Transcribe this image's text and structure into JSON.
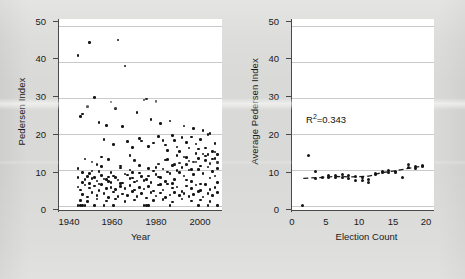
{
  "figure": {
    "background_color": "#d9d9d7",
    "panel_background": "#ffffff",
    "dot_color": "#151515",
    "axis_color": "#4a4a4a",
    "grid_color": "#c9c9c9"
  },
  "chart_data": [
    {
      "type": "scatter",
      "panel": "left",
      "title": "",
      "xlabel": "Year",
      "ylabel": "Pedersen Index",
      "xlim": [
        1938,
        2007
      ],
      "ylim": [
        -1.5,
        52
      ],
      "xticks": [
        1940,
        1960,
        1980,
        2000
      ],
      "yticks": [
        0,
        10,
        20,
        30,
        40,
        50
      ],
      "xticklabels": [
        "1940",
        "1960",
        "1980",
        "2000"
      ],
      "yticklabels": [
        "0",
        "10",
        "20",
        "30",
        "40",
        "50"
      ],
      "grid": true,
      "grid_axis": "y",
      "legend": "none",
      "points": [
        [
          1946,
          41.8
        ],
        [
          1951,
          45.4
        ],
        [
          1963,
          46.2
        ],
        [
          1966,
          38.9
        ],
        [
          1953,
          30.1
        ],
        [
          1960,
          28.9
        ],
        [
          1950,
          27.6
        ],
        [
          1962,
          27.1
        ],
        [
          1947,
          24.9
        ],
        [
          1948,
          25.5
        ],
        [
          1975,
          29.7
        ],
        [
          1974,
          29.4
        ],
        [
          1979,
          29.0
        ],
        [
          1971,
          26.0
        ],
        [
          1977,
          24.0
        ],
        [
          1958,
          22.3
        ],
        [
          1955,
          23.1
        ],
        [
          1965,
          22.0
        ],
        [
          1981,
          22.8
        ],
        [
          1985,
          23.6
        ],
        [
          1991,
          22.2
        ],
        [
          1995,
          21.5
        ],
        [
          1999,
          20.9
        ],
        [
          2002,
          20.1
        ],
        [
          1957,
          18.4
        ],
        [
          1961,
          17.1
        ],
        [
          1967,
          17.9
        ],
        [
          1969,
          16.2
        ],
        [
          1972,
          18.7
        ],
        [
          1973,
          18.0
        ],
        [
          1976,
          16.4
        ],
        [
          1978,
          17.4
        ],
        [
          1980,
          19.2
        ],
        [
          1982,
          18.1
        ],
        [
          1983,
          16.9
        ],
        [
          1984,
          15.4
        ],
        [
          1986,
          19.6
        ],
        [
          1987,
          18.2
        ],
        [
          1988,
          16.3
        ],
        [
          1989,
          15.0
        ],
        [
          1990,
          18.9
        ],
        [
          1992,
          17.6
        ],
        [
          1993,
          16.1
        ],
        [
          1994,
          19.1
        ],
        [
          1996,
          17.2
        ],
        [
          1997,
          15.8
        ],
        [
          1998,
          18.4
        ],
        [
          2000,
          16.0
        ],
        [
          2001,
          19.8
        ],
        [
          2003,
          15.1
        ],
        [
          2004,
          17.3
        ],
        [
          2005,
          14.2
        ],
        [
          1949,
          13.0
        ],
        [
          1952,
          12.1
        ],
        [
          1954,
          11.4
        ],
        [
          1956,
          13.5
        ],
        [
          1959,
          12.8
        ],
        [
          1964,
          11.0
        ],
        [
          1968,
          13.9
        ],
        [
          1970,
          12.5
        ],
        [
          1946,
          10.4
        ],
        [
          1948,
          9.2
        ],
        [
          1950,
          8.1
        ],
        [
          1952,
          7.6
        ],
        [
          1954,
          6.9
        ],
        [
          1956,
          8.4
        ],
        [
          1958,
          7.2
        ],
        [
          1960,
          6.4
        ],
        [
          1962,
          7.9
        ],
        [
          1964,
          6.1
        ],
        [
          1966,
          8.8
        ],
        [
          1968,
          7.5
        ],
        [
          1970,
          6.6
        ],
        [
          1972,
          9.1
        ],
        [
          1974,
          7.0
        ],
        [
          1976,
          8.2
        ],
        [
          1978,
          9.6
        ],
        [
          1980,
          8.0
        ],
        [
          1982,
          10.2
        ],
        [
          1984,
          9.4
        ],
        [
          1986,
          11.1
        ],
        [
          1988,
          9.8
        ],
        [
          1990,
          10.6
        ],
        [
          1992,
          11.4
        ],
        [
          1994,
          10.0
        ],
        [
          1996,
          12.2
        ],
        [
          1998,
          11.0
        ],
        [
          2000,
          12.6
        ],
        [
          2002,
          11.8
        ],
        [
          2004,
          13.1
        ],
        [
          2005,
          12.0
        ],
        [
          1946,
          5.2
        ],
        [
          1947,
          4.4
        ],
        [
          1948,
          3.1
        ],
        [
          1949,
          5.8
        ],
        [
          1950,
          2.4
        ],
        [
          1951,
          4.9
        ],
        [
          1952,
          3.6
        ],
        [
          1953,
          5.5
        ],
        [
          1954,
          2.8
        ],
        [
          1955,
          4.2
        ],
        [
          1956,
          5.9
        ],
        [
          1957,
          3.4
        ],
        [
          1958,
          4.7
        ],
        [
          1959,
          2.2
        ],
        [
          1960,
          5.1
        ],
        [
          1961,
          3.8
        ],
        [
          1962,
          4.5
        ],
        [
          1963,
          2.6
        ],
        [
          1964,
          5.4
        ],
        [
          1965,
          3.2
        ],
        [
          1966,
          4.8
        ],
        [
          1967,
          2.9
        ],
        [
          1968,
          5.6
        ],
        [
          1969,
          3.9
        ],
        [
          1970,
          4.3
        ],
        [
          1971,
          2.5
        ],
        [
          1972,
          5.0
        ],
        [
          1973,
          3.3
        ],
        [
          1974,
          4.6
        ],
        [
          1975,
          2.1
        ],
        [
          1976,
          5.3
        ],
        [
          1977,
          3.7
        ],
        [
          1978,
          4.1
        ],
        [
          1979,
          2.7
        ],
        [
          1980,
          5.7
        ],
        [
          1981,
          3.5
        ],
        [
          1982,
          4.4
        ],
        [
          1983,
          2.3
        ],
        [
          1984,
          6.0
        ],
        [
          1985,
          3.0
        ],
        [
          1986,
          4.9
        ],
        [
          1987,
          3.6
        ],
        [
          1988,
          5.2
        ],
        [
          1989,
          2.8
        ],
        [
          1990,
          4.0
        ],
        [
          1991,
          3.4
        ],
        [
          1992,
          5.5
        ],
        [
          1993,
          2.6
        ],
        [
          1994,
          4.7
        ],
        [
          1995,
          3.1
        ],
        [
          1996,
          5.8
        ],
        [
          1997,
          3.9
        ],
        [
          1998,
          4.2
        ],
        [
          1999,
          2.4
        ],
        [
          2000,
          5.9
        ],
        [
          2001,
          3.3
        ],
        [
          2002,
          4.5
        ],
        [
          2003,
          2.9
        ],
        [
          2004,
          5.1
        ],
        [
          2005,
          3.7
        ],
        [
          1946,
          0.0
        ],
        [
          1947,
          0.0
        ],
        [
          1948,
          0.0
        ],
        [
          1949,
          0.0
        ],
        [
          1953,
          0.0
        ],
        [
          1957,
          0.0
        ],
        [
          1961,
          0.0
        ],
        [
          1974,
          0.0
        ],
        [
          1975,
          0.0
        ],
        [
          1976,
          0.0
        ],
        [
          1985,
          0.0
        ],
        [
          1997,
          0.0
        ],
        [
          2001,
          0.0
        ],
        [
          2005,
          0.0
        ],
        [
          1948,
          6.5
        ],
        [
          1949,
          7.3
        ],
        [
          1951,
          6.2
        ],
        [
          1953,
          7.8
        ],
        [
          1955,
          6.0
        ],
        [
          1957,
          7.4
        ],
        [
          1959,
          6.8
        ],
        [
          1961,
          8.3
        ],
        [
          1963,
          7.1
        ],
        [
          1965,
          6.3
        ],
        [
          1967,
          8.5
        ],
        [
          1969,
          7.7
        ],
        [
          1971,
          6.9
        ],
        [
          1973,
          8.1
        ],
        [
          1975,
          7.2
        ],
        [
          1977,
          6.5
        ],
        [
          1979,
          8.7
        ],
        [
          1981,
          7.9
        ],
        [
          1983,
          6.7
        ],
        [
          1985,
          8.9
        ],
        [
          1987,
          7.3
        ],
        [
          1989,
          9.3
        ],
        [
          1991,
          8.2
        ],
        [
          1993,
          9.9
        ],
        [
          1995,
          8.6
        ],
        [
          1997,
          10.1
        ],
        [
          1999,
          9.0
        ],
        [
          2001,
          10.8
        ],
        [
          2003,
          9.5
        ],
        [
          2005,
          10.3
        ],
        [
          1947,
          1.5
        ],
        [
          1950,
          1.1
        ],
        [
          1954,
          1.8
        ],
        [
          1958,
          1.3
        ],
        [
          1962,
          1.9
        ],
        [
          1966,
          1.2
        ],
        [
          1970,
          1.6
        ],
        [
          1978,
          1.4
        ],
        [
          1982,
          1.7
        ],
        [
          1986,
          1.0
        ],
        [
          1990,
          1.9
        ],
        [
          1994,
          1.3
        ],
        [
          1998,
          1.6
        ],
        [
          2002,
          1.2
        ],
        [
          1984,
          12.9
        ],
        [
          1988,
          14.0
        ],
        [
          1992,
          13.4
        ],
        [
          1996,
          14.6
        ],
        [
          2000,
          13.8
        ],
        [
          2004,
          14.9
        ],
        [
          1989,
          11.9
        ],
        [
          1993,
          12.4
        ],
        [
          1997,
          13.2
        ],
        [
          2001,
          14.3
        ],
        [
          1952,
          9.7
        ],
        [
          1956,
          10.9
        ],
        [
          1960,
          9.3
        ],
        [
          1964,
          10.5
        ],
        [
          1968,
          9.9
        ],
        [
          1972,
          11.2
        ],
        [
          1976,
          10.4
        ],
        [
          1980,
          11.6
        ],
        [
          1983,
          12.7
        ],
        [
          1987,
          11.5
        ],
        [
          1991,
          13.6
        ],
        [
          1995,
          12.1
        ],
        [
          1999,
          14.4
        ],
        [
          2003,
          13.0
        ],
        [
          1946,
          7.9
        ],
        [
          1951,
          8.9
        ],
        [
          1955,
          9.5
        ],
        [
          1959,
          8.0
        ],
        [
          1969,
          9.2
        ],
        [
          1979,
          10.7
        ],
        [
          1986,
          6.2
        ],
        [
          1994,
          6.8
        ],
        [
          2002,
          7.7
        ],
        [
          2005,
          6.4
        ],
        [
          1981,
          5.9
        ],
        [
          1992,
          7.1
        ],
        [
          1998,
          6.0
        ],
        [
          2004,
          8.3
        ]
      ]
    },
    {
      "type": "scatter",
      "panel": "right",
      "title": "",
      "xlabel": "Election Count",
      "ylabel": "Average Pedersen Index",
      "xlim": [
        -0.5,
        20.8
      ],
      "ylim": [
        -1.5,
        52
      ],
      "xticks": [
        0,
        5,
        10,
        15,
        20
      ],
      "yticks": [
        0,
        10,
        20,
        30,
        40,
        50
      ],
      "xticklabels": [
        "0",
        "5",
        "10",
        "15",
        "20"
      ],
      "yticklabels": [
        "0",
        "10",
        "20",
        "30",
        "40",
        "50"
      ],
      "grid": true,
      "grid_axis": "y",
      "legend": "none",
      "annotation": "R²=0.343",
      "annotation_base": "R",
      "annotation_sup": "2",
      "annotation_rest": "=0.343",
      "annotation_x": 7.2,
      "annotation_y": 25.5,
      "points": [
        [
          1,
          0.1
        ],
        [
          2,
          14.0
        ],
        [
          3,
          9.4
        ],
        [
          3,
          7.6
        ],
        [
          4,
          7.9
        ],
        [
          5,
          8.3
        ],
        [
          5,
          7.7
        ],
        [
          6,
          8.5
        ],
        [
          6,
          7.8
        ],
        [
          7,
          8.6
        ],
        [
          7,
          7.9
        ],
        [
          8,
          8.3
        ],
        [
          8,
          7.6
        ],
        [
          9,
          7.1
        ],
        [
          9,
          8.1
        ],
        [
          10,
          7.8
        ],
        [
          10,
          6.9
        ],
        [
          11,
          6.5
        ],
        [
          11,
          7.4
        ],
        [
          12,
          8.6
        ],
        [
          12,
          9.0
        ],
        [
          13,
          9.6
        ],
        [
          13,
          9.1
        ],
        [
          14,
          9.9
        ],
        [
          14,
          9.3
        ],
        [
          15,
          9.6
        ],
        [
          15,
          9.2
        ],
        [
          16,
          7.8
        ],
        [
          17,
          11.5
        ],
        [
          17,
          10.5
        ],
        [
          18,
          11.0
        ],
        [
          18,
          10.3
        ],
        [
          19,
          11.2
        ],
        [
          19,
          10.8
        ]
      ],
      "trend_line": {
        "style": "dashed",
        "x": [
          1.2,
          3.5,
          6.0,
          8.5,
          11.0,
          13.0,
          15.0,
          17.0,
          19.3
        ],
        "y": [
          7.6,
          7.8,
          8.1,
          8.0,
          8.2,
          9.2,
          9.7,
          10.4,
          11.1
        ]
      }
    }
  ]
}
